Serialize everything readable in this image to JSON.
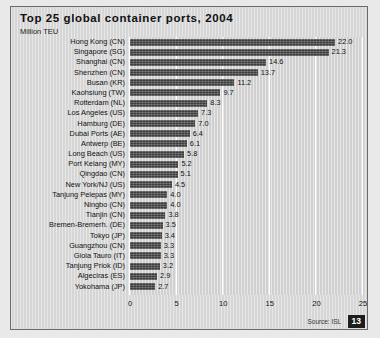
{
  "figure": {
    "title": "Top 25 global container ports, 2004",
    "subtitle": "Million TEU",
    "source": "Source: ISL",
    "page_number": "13",
    "colors": {
      "bar": "#4d4d4d",
      "plot_background": "#d4d4d4",
      "gridline": "#ffffff",
      "frame": "#6b6b6b",
      "badge": "#1d1d1d"
    }
  },
  "chart_data": {
    "type": "bar",
    "orientation": "horizontal",
    "title": "Top 25 global container ports, 2004",
    "subtitle": "Million TEU",
    "xlabel": "",
    "ylabel": "",
    "xlim": [
      0,
      25
    ],
    "ticks": [
      "0",
      "5",
      "10",
      "15",
      "20",
      "25"
    ],
    "tick_values": [
      0,
      5,
      10,
      15,
      20,
      25
    ],
    "grid": true,
    "legend": null,
    "source": "Source: ISL",
    "categories": [
      "Hong Kong (CN)",
      "Singapore (SG)",
      "Shanghai (CN)",
      "Shenzhen (CN)",
      "Busan (KR)",
      "Kaohsiung (TW)",
      "Rotterdam (NL)",
      "Los Angeles (US)",
      "Hamburg (DE)",
      "Dubai Ports (AE)",
      "Antwerp (BE)",
      "Long Beach (US)",
      "Port Kelang (MY)",
      "Qingdao (CN)",
      "New York/NJ (US)",
      "Tanjung Pelepas (MY)",
      "Ningbo (CN)",
      "Tianjin (CN)",
      "Bremen-Bremerh. (DE)",
      "Tokyo (JP)",
      "Guangzhou (CN)",
      "Gioia Tauro (IT)",
      "Tanjung Priok (ID)",
      "Algeciras (ES)",
      "Yokohama (JP)"
    ],
    "values": [
      22.0,
      21.3,
      14.6,
      13.7,
      11.2,
      9.7,
      8.3,
      7.3,
      7.0,
      6.4,
      6.1,
      5.8,
      5.2,
      5.1,
      4.5,
      4.0,
      4.0,
      3.8,
      3.5,
      3.4,
      3.3,
      3.3,
      3.2,
      2.9,
      2.7
    ],
    "value_labels": [
      "22.0",
      "21.3",
      "14.6",
      "13.7",
      "11.2",
      "9.7",
      "8.3",
      "7.3",
      "7.0",
      "6.4",
      "6.1",
      "5.8",
      "5.2",
      "5.1",
      "4.5",
      "4.0",
      "4.0",
      "3.8",
      "3.5",
      "3.4",
      "3.3",
      "3.3",
      "3.2",
      "2.9",
      "2.7"
    ]
  }
}
